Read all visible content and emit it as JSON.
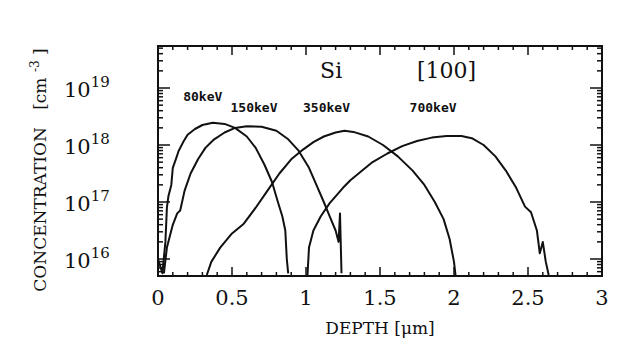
{
  "chart_data": {
    "type": "line",
    "title": "",
    "annotations": [
      {
        "text": "Si",
        "x_um": 1.17,
        "log_conc": 19.18
      },
      {
        "text": "[100]",
        "x_um": 1.95,
        "log_conc": 19.18
      }
    ],
    "xlabel": "DEPTH [μm]",
    "ylabel": "CONCENTRATION  [cm⁻³]",
    "ylabel_main": "CONCENTRATION",
    "ylabel_unit": "[cm",
    "ylabel_unit_exp": "-3",
    "ylabel_unit_close": "]",
    "xlim": [
      0,
      3
    ],
    "ylim_log10": [
      15.7,
      19.73
    ],
    "yscale": "log",
    "grid": false,
    "legend": "inline labels",
    "x_ticks": [
      {
        "value": 0,
        "label": "0"
      },
      {
        "value": 0.5,
        "label": "0.5"
      },
      {
        "value": 1,
        "label": "1"
      },
      {
        "value": 1.5,
        "label": "1.5"
      },
      {
        "value": 2,
        "label": "2"
      },
      {
        "value": 2.5,
        "label": "2.5"
      },
      {
        "value": 3,
        "label": "3"
      }
    ],
    "y_ticks": [
      {
        "log": 16,
        "base": "10",
        "exp": "16"
      },
      {
        "log": 17,
        "base": "10",
        "exp": "17"
      },
      {
        "log": 18,
        "base": "10",
        "exp": "18"
      },
      {
        "log": 19,
        "base": "10",
        "exp": "19"
      }
    ],
    "series": [
      {
        "name": "80keV",
        "label_pos": {
          "x_um": 0.17,
          "log_conc": 18.78
        },
        "points": [
          [
            0.0,
            16.0
          ],
          [
            0.03,
            15.75
          ],
          [
            0.05,
            16.3
          ],
          [
            0.06,
            16.9
          ],
          [
            0.07,
            17.1
          ],
          [
            0.09,
            17.3
          ],
          [
            0.1,
            17.6
          ],
          [
            0.12,
            17.75
          ],
          [
            0.14,
            17.9
          ],
          [
            0.17,
            18.05
          ],
          [
            0.2,
            18.18
          ],
          [
            0.25,
            18.28
          ],
          [
            0.3,
            18.35
          ],
          [
            0.37,
            18.39
          ],
          [
            0.45,
            18.37
          ],
          [
            0.52,
            18.3
          ],
          [
            0.6,
            18.15
          ],
          [
            0.66,
            17.95
          ],
          [
            0.72,
            17.65
          ],
          [
            0.77,
            17.35
          ],
          [
            0.81,
            17.0
          ],
          [
            0.84,
            16.75
          ],
          [
            0.86,
            16.5
          ],
          [
            0.87,
            16.0
          ],
          [
            0.88,
            15.75
          ]
        ]
      },
      {
        "name": "150keV",
        "label_pos": {
          "x_um": 0.49,
          "log_conc": 18.58
        },
        "points": [
          [
            0.04,
            15.75
          ],
          [
            0.06,
            16.2
          ],
          [
            0.1,
            16.6
          ],
          [
            0.13,
            16.8
          ],
          [
            0.15,
            16.85
          ],
          [
            0.18,
            17.2
          ],
          [
            0.22,
            17.5
          ],
          [
            0.27,
            17.75
          ],
          [
            0.32,
            17.95
          ],
          [
            0.38,
            18.1
          ],
          [
            0.45,
            18.22
          ],
          [
            0.52,
            18.3
          ],
          [
            0.6,
            18.33
          ],
          [
            0.7,
            18.32
          ],
          [
            0.8,
            18.25
          ],
          [
            0.88,
            18.1
          ],
          [
            0.95,
            17.9
          ],
          [
            1.02,
            17.6
          ],
          [
            1.07,
            17.3
          ],
          [
            1.12,
            17.0
          ],
          [
            1.16,
            16.75
          ],
          [
            1.2,
            16.5
          ],
          [
            1.22,
            16.3
          ],
          [
            1.23,
            16.8
          ],
          [
            1.24,
            15.75
          ]
        ]
      },
      {
        "name": "350keV",
        "label_pos": {
          "x_um": 0.98,
          "log_conc": 18.58
        },
        "points": [
          [
            0.33,
            15.72
          ],
          [
            0.36,
            15.95
          ],
          [
            0.42,
            16.2
          ],
          [
            0.5,
            16.45
          ],
          [
            0.58,
            16.62
          ],
          [
            0.66,
            16.9
          ],
          [
            0.74,
            17.2
          ],
          [
            0.82,
            17.5
          ],
          [
            0.9,
            17.75
          ],
          [
            0.98,
            17.92
          ],
          [
            1.05,
            18.05
          ],
          [
            1.12,
            18.15
          ],
          [
            1.2,
            18.22
          ],
          [
            1.26,
            18.25
          ],
          [
            1.32,
            18.23
          ],
          [
            1.42,
            18.15
          ],
          [
            1.52,
            18.0
          ],
          [
            1.62,
            17.8
          ],
          [
            1.72,
            17.55
          ],
          [
            1.8,
            17.3
          ],
          [
            1.87,
            17.0
          ],
          [
            1.93,
            16.7
          ],
          [
            1.97,
            16.35
          ],
          [
            2.0,
            15.95
          ],
          [
            2.01,
            15.72
          ]
        ]
      },
      {
        "name": "700keV",
        "label_pos": {
          "x_um": 1.7,
          "log_conc": 18.58
        },
        "points": [
          [
            1.01,
            15.72
          ],
          [
            1.02,
            16.2
          ],
          [
            1.05,
            16.5
          ],
          [
            1.1,
            16.75
          ],
          [
            1.16,
            16.98
          ],
          [
            1.2,
            17.1
          ],
          [
            1.25,
            17.25
          ],
          [
            1.3,
            17.38
          ],
          [
            1.38,
            17.55
          ],
          [
            1.45,
            17.7
          ],
          [
            1.55,
            17.85
          ],
          [
            1.65,
            17.98
          ],
          [
            1.75,
            18.07
          ],
          [
            1.85,
            18.13
          ],
          [
            1.95,
            18.16
          ],
          [
            2.05,
            18.16
          ],
          [
            2.12,
            18.12
          ],
          [
            2.2,
            18.0
          ],
          [
            2.28,
            17.8
          ],
          [
            2.35,
            17.55
          ],
          [
            2.42,
            17.25
          ],
          [
            2.48,
            16.92
          ],
          [
            2.52,
            16.82
          ],
          [
            2.56,
            16.5
          ],
          [
            2.58,
            16.1
          ],
          [
            2.6,
            16.3
          ],
          [
            2.62,
            15.95
          ],
          [
            2.64,
            15.72
          ]
        ]
      }
    ]
  }
}
